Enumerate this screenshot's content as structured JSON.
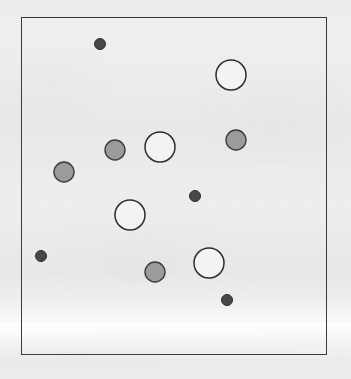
{
  "figure": {
    "title": "",
    "background_color": "#f0efed",
    "canvas": {
      "width": 351,
      "height": 379
    },
    "frame": {
      "name": "plot-frame",
      "x": 21,
      "y": 17,
      "width": 306,
      "height": 338,
      "stroke_color": "#3a3a3c",
      "stroke_width": 1.6,
      "fill": "none"
    },
    "scan_artifact": {
      "description": "bright horizontal scanner band",
      "y": 318,
      "height": 14,
      "color": "#ffffff"
    }
  },
  "legend": {
    "visible": false,
    "categories": [
      {
        "key": "small-dark",
        "label": "small dark",
        "radius": 5.5,
        "fill": "#48484a",
        "stroke": "#2e2e30",
        "count": 4
      },
      {
        "key": "medium-gray",
        "label": "medium gray",
        "radius": 10,
        "fill": "#9b9b99",
        "stroke": "#3a3a3c",
        "count": 4
      },
      {
        "key": "large-white",
        "label": "large white",
        "radius": 15,
        "fill": "#f4f3f1",
        "stroke": "#2e2e30",
        "count": 4
      }
    ]
  },
  "chart_data": {
    "type": "scatter",
    "title": "",
    "xlabel": "",
    "ylabel": "",
    "grid": false,
    "legend_position": "none",
    "axis_ticks": false,
    "xlim": [
      21,
      327
    ],
    "ylim": [
      17,
      355
    ],
    "point_count": 12,
    "size_classes": {
      "small": 5.5,
      "medium": 10,
      "large": 15
    },
    "color_classes": {
      "dark": "#48484a",
      "gray": "#9b9b99",
      "white": "#f4f3f1"
    },
    "series": [
      {
        "name": "small dark",
        "marker": "filled-circle",
        "fill": "#48484a",
        "stroke": "#2e2e30",
        "radius": 5.5,
        "points": [
          {
            "x": 100,
            "y": 44
          },
          {
            "x": 195,
            "y": 196
          },
          {
            "x": 41,
            "y": 256
          },
          {
            "x": 227,
            "y": 300
          }
        ]
      },
      {
        "name": "medium gray",
        "marker": "filled-circle",
        "fill": "#9b9b99",
        "stroke": "#3a3a3c",
        "radius": 10,
        "points": [
          {
            "x": 115,
            "y": 150
          },
          {
            "x": 236,
            "y": 140
          },
          {
            "x": 64,
            "y": 172
          },
          {
            "x": 155,
            "y": 272
          }
        ]
      },
      {
        "name": "large white",
        "marker": "open-circle",
        "fill": "#f4f3f1",
        "stroke": "#2e2e30",
        "radius": 15,
        "points": [
          {
            "x": 231,
            "y": 75
          },
          {
            "x": 160,
            "y": 147
          },
          {
            "x": 130,
            "y": 215
          },
          {
            "x": 209,
            "y": 263
          }
        ]
      }
    ]
  }
}
